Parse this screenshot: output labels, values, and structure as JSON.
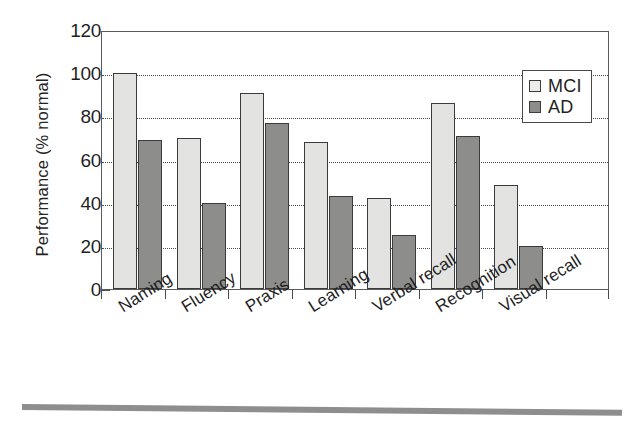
{
  "chart_data": {
    "type": "bar",
    "title": "",
    "xlabel": "",
    "ylabel": "Performance (% normal)",
    "ylim": [
      0,
      120
    ],
    "yticks": [
      0,
      20,
      40,
      60,
      80,
      100,
      120
    ],
    "ytick_labels": [
      "0",
      "20",
      "40",
      "60",
      "80",
      "100",
      "120"
    ],
    "grid": "horizontal-dotted",
    "legend_position": "top-right",
    "categories": [
      "Naming",
      "Fluency",
      "Praxis",
      "Learning",
      "Verbal recall",
      "Recognition",
      "Visual recall"
    ],
    "series": [
      {
        "name": "MCI",
        "color": "#e3e3e1",
        "values": [
          100,
          70,
          91,
          68,
          42,
          86,
          48
        ]
      },
      {
        "name": "AD",
        "color": "#8d8d8b",
        "values": [
          69,
          40,
          77,
          43,
          25,
          71,
          20
        ]
      }
    ]
  },
  "legend": {
    "items": [
      {
        "label": "MCI",
        "swatch": "mci"
      },
      {
        "label": "AD",
        "swatch": "ad"
      }
    ]
  },
  "axes": {
    "y_title": "Performance (% normal)"
  }
}
